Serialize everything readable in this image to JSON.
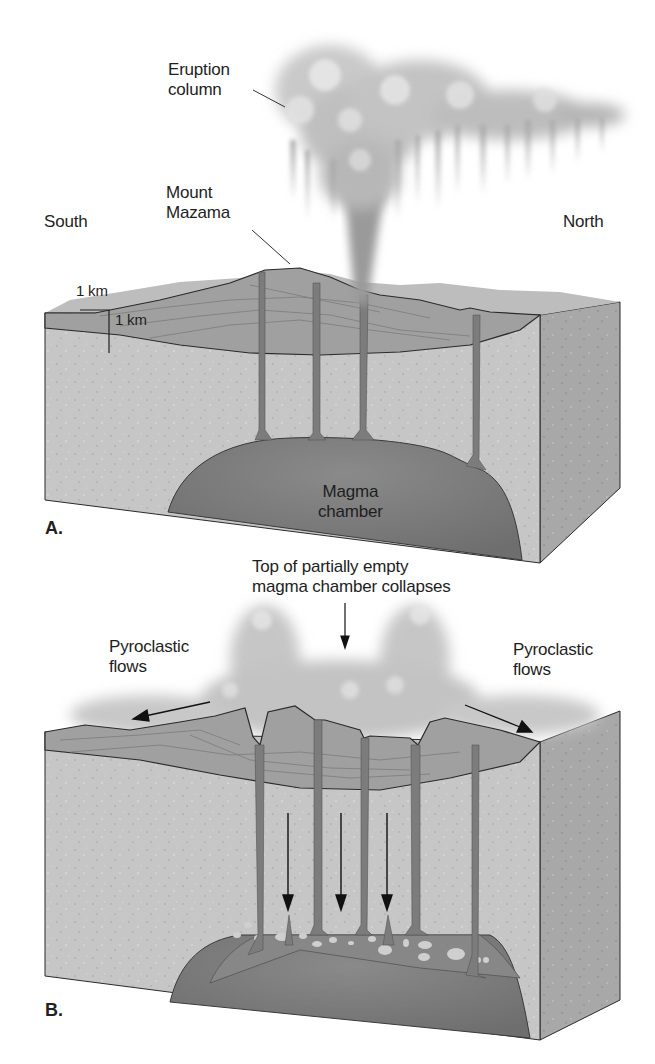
{
  "figure": {
    "panel_a": {
      "letter": "A.",
      "labels": {
        "eruption_column": [
          "Eruption",
          "column"
        ],
        "mount_mazama": [
          "Mount",
          "Mazama"
        ],
        "south": "South",
        "north": "North",
        "scale_horizontal": "1 km",
        "scale_vertical": "1 km",
        "magma_chamber": [
          "Magma",
          "chamber"
        ]
      }
    },
    "panel_b": {
      "letter": "B.",
      "labels": {
        "collapse_note": [
          "Top of partially empty",
          "magma chamber collapses"
        ],
        "pyroclastic_left": [
          "Pyroclastic",
          "flows"
        ],
        "pyroclastic_right": [
          "Pyroclastic",
          "flows"
        ]
      }
    },
    "colors": {
      "background": "#ffffff",
      "rock_front": "#c4c4c4",
      "rock_side": "#a9a9a9",
      "volcanic_layers": "#9d9d9d",
      "conduit": "#7d7d7d",
      "magma": "#7a7a7a",
      "cloud": "#c8c8c8",
      "outline": "#2a2a2a"
    }
  }
}
